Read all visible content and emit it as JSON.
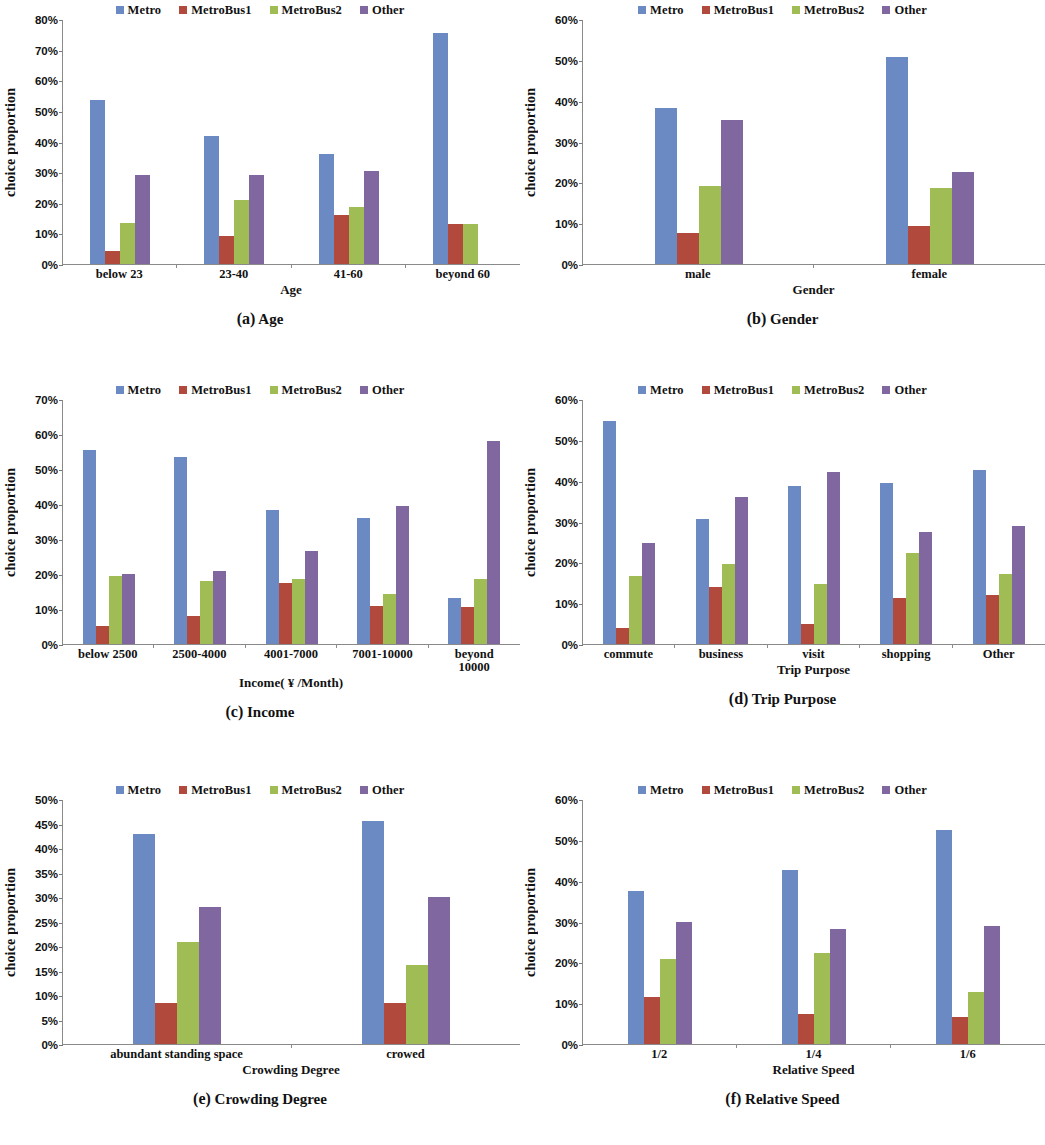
{
  "series_colors": {
    "Metro": "#6B8AC4",
    "MetroBus1": "#B14A3C",
    "MetroBus2": "#9FBC55",
    "Other": "#81679F"
  },
  "legend": [
    "Metro",
    "MetroBus1",
    "MetroBus2",
    "Other"
  ],
  "common_ylabel": "choice proportion",
  "panels": [
    {
      "tag": "(a)",
      "name": "Age"
    },
    {
      "tag": "(b)",
      "name": "Gender"
    },
    {
      "tag": "(c)",
      "name": "Income"
    },
    {
      "tag": "(d)",
      "name": "Trip Purpose"
    },
    {
      "tag": "(e)",
      "name": "Crowding Degree"
    },
    {
      "tag": "(f)",
      "name": "Relative Speed"
    }
  ],
  "chart_data": [
    {
      "id": "a",
      "type": "bar",
      "title": "(a) Age",
      "xlabel": "Age",
      "ylabel": "choice proportion",
      "categories": [
        "below 23",
        "23-40",
        "41-60",
        "beyond 60"
      ],
      "series": [
        {
          "name": "Metro",
          "values": [
            53.7,
            41.9,
            36.0,
            75.5
          ]
        },
        {
          "name": "MetroBus1",
          "values": [
            4.4,
            9.0,
            16.0,
            13.0
          ]
        },
        {
          "name": "MetroBus2",
          "values": [
            13.3,
            21.0,
            18.7,
            13.0
          ]
        },
        {
          "name": "Other",
          "values": [
            29.0,
            29.1,
            30.4,
            0.0
          ]
        }
      ],
      "ylim": [
        0,
        80
      ],
      "ytick_step": 10,
      "yticks": [
        "0%",
        "10%",
        "20%",
        "30%",
        "40%",
        "50%",
        "60%",
        "70%",
        "80%"
      ],
      "grid": false,
      "legend_position": "top-center"
    },
    {
      "id": "b",
      "type": "bar",
      "title": "(b) Gender",
      "xlabel": "Gender",
      "ylabel": "choice proportion",
      "categories": [
        "male",
        "female"
      ],
      "series": [
        {
          "name": "Metro",
          "values": [
            38.3,
            50.6
          ]
        },
        {
          "name": "MetroBus1",
          "values": [
            7.6,
            9.2
          ]
        },
        {
          "name": "MetroBus2",
          "values": [
            19.1,
            18.5
          ]
        },
        {
          "name": "Other",
          "values": [
            35.3,
            22.5
          ]
        }
      ],
      "ylim": [
        0,
        60
      ],
      "ytick_step": 10,
      "yticks": [
        "0%",
        "10%",
        "20%",
        "30%",
        "40%",
        "50%",
        "60%"
      ],
      "grid": false,
      "legend_position": "top-center"
    },
    {
      "id": "c",
      "type": "bar",
      "title": "(c) Income",
      "xlabel": "Income( ¥ /Month)",
      "ylabel": "choice proportion",
      "categories": [
        "below 2500",
        "2500-4000",
        "4001-7000",
        "7001-10000",
        "beyond\n10000"
      ],
      "series": [
        {
          "name": "Metro",
          "values": [
            55.3,
            53.3,
            38.3,
            36.0,
            13.2
          ]
        },
        {
          "name": "MetroBus1",
          "values": [
            5.1,
            8.1,
            17.3,
            11.0,
            10.7
          ]
        },
        {
          "name": "MetroBus2",
          "values": [
            19.5,
            17.9,
            18.6,
            14.4,
            18.6
          ]
        },
        {
          "name": "Other",
          "values": [
            20.1,
            21.0,
            26.6,
            39.5,
            58.0
          ]
        }
      ],
      "ylim": [
        0,
        70
      ],
      "ytick_step": 10,
      "yticks": [
        "0%",
        "10%",
        "20%",
        "30%",
        "40%",
        "50%",
        "60%",
        "70%"
      ],
      "grid": false,
      "legend_position": "top-center"
    },
    {
      "id": "d",
      "type": "bar",
      "title": "(d) Trip Purpose",
      "xlabel": "Trip  Purpose",
      "ylabel": "choice proportion",
      "categories": [
        "commute",
        "business",
        "visit",
        "shopping",
        "Other"
      ],
      "series": [
        {
          "name": "Metro",
          "values": [
            54.5,
            30.5,
            38.7,
            39.5,
            42.6
          ]
        },
        {
          "name": "MetroBus1",
          "values": [
            4.0,
            13.9,
            5.0,
            11.3,
            11.9
          ]
        },
        {
          "name": "MetroBus2",
          "values": [
            16.7,
            19.5,
            14.7,
            22.4,
            17.2
          ]
        },
        {
          "name": "Other",
          "values": [
            24.7,
            36.0,
            42.1,
            27.5,
            29.0
          ]
        }
      ],
      "ylim": [
        0,
        60
      ],
      "ytick_step": 10,
      "yticks": [
        "0%",
        "10%",
        "20%",
        "30%",
        "40%",
        "50%",
        "60%"
      ],
      "grid": false,
      "legend_position": "top-center"
    },
    {
      "id": "e",
      "type": "bar",
      "title": "(e) Crowding Degree",
      "xlabel": "Crowding Degree",
      "ylabel": "choice proportion",
      "categories": [
        "abundant standing space",
        "crowed"
      ],
      "series": [
        {
          "name": "Metro",
          "values": [
            42.8,
            45.5
          ]
        },
        {
          "name": "MetroBus1",
          "values": [
            8.4,
            8.4
          ]
        },
        {
          "name": "MetroBus2",
          "values": [
            20.8,
            16.2
          ]
        },
        {
          "name": "Other",
          "values": [
            27.9,
            30.1
          ]
        }
      ],
      "ylim": [
        0,
        50
      ],
      "ytick_step": 5,
      "yticks": [
        "0%",
        "5%",
        "10%",
        "15%",
        "20%",
        "25%",
        "30%",
        "35%",
        "40%",
        "45%",
        "50%"
      ],
      "grid": false,
      "legend_position": "top-center"
    },
    {
      "id": "f",
      "type": "bar",
      "title": "(f) Relative Speed",
      "xlabel": "Relative  Speed",
      "ylabel": "choice proportion",
      "categories": [
        "1/2",
        "1/4",
        "1/6"
      ],
      "series": [
        {
          "name": "Metro",
          "values": [
            37.5,
            42.5,
            52.3
          ]
        },
        {
          "name": "MetroBus1",
          "values": [
            11.4,
            7.4,
            6.7
          ]
        },
        {
          "name": "MetroBus2",
          "values": [
            20.8,
            22.3,
            12.8
          ]
        },
        {
          "name": "Other",
          "values": [
            30.0,
            28.1,
            29.0
          ]
        }
      ],
      "ylim": [
        0,
        60
      ],
      "ytick_step": 10,
      "yticks": [
        "0%",
        "10%",
        "20%",
        "30%",
        "40%",
        "50%",
        "60%"
      ],
      "grid": false,
      "legend_position": "top-center"
    }
  ]
}
